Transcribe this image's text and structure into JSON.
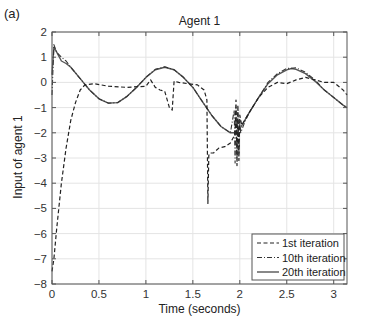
{
  "panel_label": "(a)",
  "chart_data": {
    "type": "line",
    "title": "Agent 1",
    "xlabel": "Time (seconds)",
    "ylabel": "Input of agent 1",
    "xlim": [
      0,
      3.1416
    ],
    "ylim": [
      -8,
      2
    ],
    "xticks": [
      0,
      0.5,
      1,
      1.5,
      2,
      2.5,
      3
    ],
    "xtick_labels": [
      "0",
      "0.5",
      "1",
      "1.5",
      "2",
      "2.5",
      "3"
    ],
    "yticks": [
      2,
      1,
      0,
      -1,
      -2,
      -3,
      -4,
      -5,
      -6,
      -7,
      -8
    ],
    "ytick_labels": [
      "2",
      "1",
      "0",
      "−1",
      "−2",
      "−3",
      "−4",
      "−5",
      "−6",
      "−7",
      "−8"
    ],
    "grid": true,
    "legend_position": "lower right",
    "series": [
      {
        "name": "1st iteration",
        "style": "dashed",
        "x": [
          0,
          0.02,
          0.05,
          0.1,
          0.15,
          0.2,
          0.25,
          0.3,
          0.35,
          0.45,
          0.6,
          0.8,
          1.0,
          1.05,
          1.1,
          1.15,
          1.2,
          1.25,
          1.28,
          1.3,
          1.35,
          1.45,
          1.55,
          1.62,
          1.65,
          1.66,
          1.67,
          1.68,
          1.72,
          1.78,
          1.84,
          1.9,
          1.93,
          1.95,
          1.96,
          1.97,
          1.98,
          1.99,
          2.0,
          2.02,
          2.1,
          2.2,
          2.3,
          2.4,
          2.5,
          2.6,
          2.7,
          2.8,
          2.9,
          3.0,
          3.1,
          3.1416
        ],
        "y": [
          -7.5,
          -7.0,
          -5.8,
          -4.0,
          -2.6,
          -1.5,
          -0.8,
          -0.3,
          -0.1,
          -0.05,
          -0.15,
          -0.2,
          -0.15,
          0.1,
          -0.2,
          -0.3,
          -0.35,
          -1.0,
          -1.1,
          0.05,
          0.0,
          -0.05,
          -0.1,
          -0.3,
          -0.7,
          -4.8,
          -2.9,
          -2.8,
          -2.8,
          -2.6,
          -2.55,
          -2.4,
          -2.2,
          -2.0,
          -0.7,
          -3.3,
          -0.9,
          -3.1,
          -1.3,
          -1.7,
          -1.2,
          -0.6,
          -0.2,
          0.0,
          -0.05,
          0.1,
          0.2,
          0.1,
          0.0,
          0.0,
          -0.3,
          -0.5
        ]
      },
      {
        "name": "10th iteration",
        "style": "dash-dot",
        "x": [
          0,
          0.02,
          0.05,
          0.1,
          0.15,
          0.2,
          0.3,
          0.4,
          0.5,
          0.6,
          0.7,
          0.8,
          0.9,
          1.0,
          1.1,
          1.2,
          1.3,
          1.4,
          1.5,
          1.6,
          1.7,
          1.8,
          1.9,
          1.94,
          1.95,
          1.96,
          1.97,
          1.98,
          1.99,
          2.0,
          2.01,
          2.05,
          2.1,
          2.2,
          2.3,
          2.4,
          2.5,
          2.6,
          2.7,
          2.8,
          2.9,
          3.0,
          3.1,
          3.1416
        ],
        "y": [
          -0.5,
          1.5,
          1.2,
          1.0,
          0.85,
          0.6,
          0.15,
          -0.3,
          -0.65,
          -0.82,
          -0.8,
          -0.55,
          -0.2,
          0.2,
          0.52,
          0.62,
          0.5,
          0.2,
          -0.2,
          -0.75,
          -1.3,
          -1.75,
          -2.0,
          -1.1,
          -3.2,
          -1.0,
          -3.0,
          -1.2,
          -2.8,
          -1.6,
          -2.0,
          -1.6,
          -1.2,
          -0.6,
          0.0,
          0.35,
          0.55,
          0.58,
          0.4,
          0.1,
          -0.3,
          -0.6,
          -0.9,
          -1.0
        ]
      },
      {
        "name": "20th iteration",
        "style": "solid",
        "x": [
          0,
          0.02,
          0.05,
          0.1,
          0.15,
          0.2,
          0.3,
          0.4,
          0.5,
          0.6,
          0.7,
          0.8,
          0.9,
          1.0,
          1.1,
          1.2,
          1.3,
          1.4,
          1.5,
          1.6,
          1.7,
          1.8,
          1.9,
          1.95,
          2.0,
          2.1,
          2.2,
          2.3,
          2.4,
          2.5,
          2.55,
          2.6,
          2.7,
          2.8,
          2.9,
          3.0,
          3.1,
          3.1416
        ],
        "y": [
          0.3,
          1.4,
          1.2,
          0.85,
          0.75,
          0.6,
          0.15,
          -0.3,
          -0.65,
          -0.82,
          -0.8,
          -0.55,
          -0.2,
          0.2,
          0.5,
          0.6,
          0.5,
          0.2,
          -0.2,
          -0.75,
          -1.3,
          -1.75,
          -2.0,
          -2.0,
          -1.85,
          -1.2,
          -0.6,
          -0.05,
          0.3,
          0.5,
          0.55,
          0.52,
          0.35,
          0.05,
          -0.3,
          -0.6,
          -0.9,
          -1.0
        ]
      }
    ]
  }
}
